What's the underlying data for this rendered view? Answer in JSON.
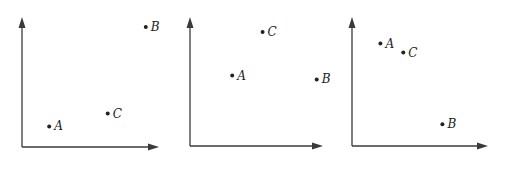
{
  "chart_data": [
    {
      "type": "scatter",
      "title": "",
      "xlabel": "",
      "ylabel": "",
      "xlim": [
        0,
        1
      ],
      "ylim": [
        0,
        1
      ],
      "grid": false,
      "ticks": false,
      "points": [
        {
          "label": "A",
          "x": 0.2,
          "y": 0.16
        },
        {
          "label": "B",
          "x": 0.91,
          "y": 0.93
        },
        {
          "label": "C",
          "x": 0.63,
          "y": 0.26
        }
      ]
    },
    {
      "type": "scatter",
      "title": "",
      "xlabel": "",
      "ylabel": "",
      "xlim": [
        0,
        1
      ],
      "ylim": [
        0,
        1
      ],
      "grid": false,
      "ticks": false,
      "points": [
        {
          "label": "A",
          "x": 0.32,
          "y": 0.55
        },
        {
          "label": "B",
          "x": 0.96,
          "y": 0.52
        },
        {
          "label": "C",
          "x": 0.55,
          "y": 0.89
        }
      ]
    },
    {
      "type": "scatter",
      "title": "",
      "xlabel": "",
      "ylabel": "",
      "xlim": [
        0,
        1
      ],
      "ylim": [
        0,
        1
      ],
      "grid": false,
      "ticks": false,
      "points": [
        {
          "label": "A",
          "x": 0.21,
          "y": 0.8
        },
        {
          "label": "B",
          "x": 0.67,
          "y": 0.17
        },
        {
          "label": "C",
          "x": 0.38,
          "y": 0.73
        }
      ]
    }
  ]
}
